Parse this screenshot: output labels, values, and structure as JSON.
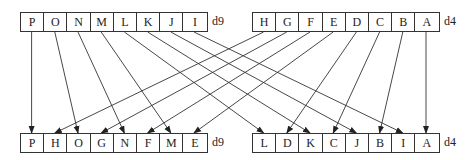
{
  "top": {
    "left": {
      "cells": [
        "P",
        "O",
        "N",
        "M",
        "L",
        "K",
        "J",
        "I"
      ],
      "label": "d9"
    },
    "right": {
      "cells": [
        "H",
        "G",
        "F",
        "E",
        "D",
        "C",
        "B",
        "A"
      ],
      "label": "d4"
    }
  },
  "bottom": {
    "left": {
      "cells": [
        "P",
        "H",
        "O",
        "G",
        "N",
        "F",
        "M",
        "E"
      ],
      "label": "d9"
    },
    "right": {
      "cells": [
        "L",
        "D",
        "K",
        "C",
        "J",
        "B",
        "I",
        "A"
      ],
      "label": "d4"
    }
  },
  "colors": {
    "line": "#333333",
    "text": "#222222"
  }
}
